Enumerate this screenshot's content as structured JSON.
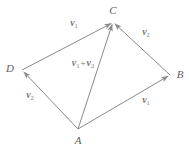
{
  "figure": {
    "caption": "",
    "stroke_color": "#8a8a8a",
    "label_color": "#6f6f6f",
    "background_color": "#ffffff",
    "width": 189,
    "height": 146,
    "type": "vector-parallelogram-diagram",
    "vertices": [
      {
        "name": "A",
        "label": "A",
        "x": 78,
        "y": 129,
        "label_x": 78,
        "label_y": 140
      },
      {
        "name": "B",
        "label": "B",
        "x": 170,
        "y": 75,
        "label_x": 180,
        "label_y": 74
      },
      {
        "name": "C",
        "label": "C",
        "x": 113,
        "y": 22,
        "label_x": 113,
        "label_y": 10
      },
      {
        "name": "D",
        "label": "D",
        "x": 22,
        "y": 70,
        "label_x": 10,
        "label_y": 68
      }
    ],
    "vectors": [
      {
        "name": "vector-a-to-b",
        "from": "A",
        "to": "B",
        "symbol": "v",
        "subscript": "1",
        "label_text": "v1",
        "label_x": 146,
        "label_y": 101,
        "arrowhead_at": "B"
      },
      {
        "name": "vector-b-to-c",
        "from": "B",
        "to": "C",
        "symbol": "v",
        "subscript": "2",
        "label_text": "v2",
        "label_x": 146,
        "label_y": 33,
        "arrowhead_at": "C"
      },
      {
        "name": "vector-a-to-d",
        "from": "A",
        "to": "D",
        "symbol": "v",
        "subscript": "2",
        "label_text": "v2",
        "label_x": 30,
        "label_y": 96,
        "arrowhead_at": "D"
      },
      {
        "name": "vector-d-to-c",
        "from": "D",
        "to": "C",
        "symbol": "v",
        "subscript": "1",
        "label_text": "v1",
        "label_x": 74,
        "label_y": 24,
        "arrowhead_at": "C"
      },
      {
        "name": "vector-a-to-c-resultant",
        "from": "A",
        "to": "C",
        "symbol": "v",
        "subscript": "1",
        "label_text": "v1 + v2",
        "label_x": 83,
        "label_y": 64,
        "arrowhead_at": "C"
      }
    ],
    "labels": {
      "vertex_a": "A",
      "vertex_b": "B",
      "vertex_c": "C",
      "vertex_d": "D",
      "v_symbol": "v",
      "sub_one": "1",
      "sub_two": "2",
      "plus_sign": "+"
    }
  }
}
